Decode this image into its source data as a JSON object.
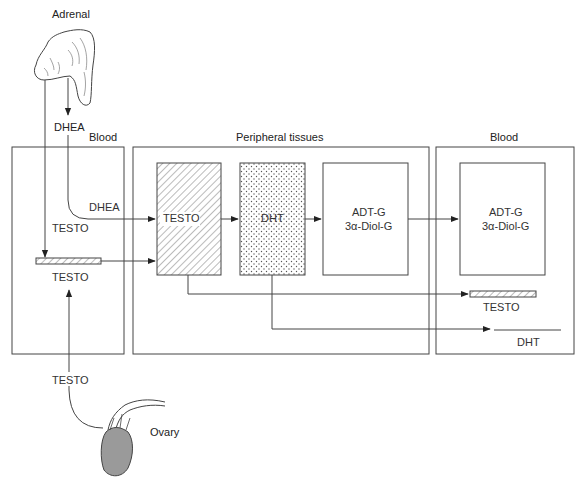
{
  "diagram": {
    "organs": {
      "adrenal": {
        "label": "Adrenal",
        "output": "DHEA"
      },
      "ovary": {
        "label": "Ovary",
        "output": "TESTO"
      }
    },
    "compartments": [
      {
        "id": "blood-left",
        "title": "Blood",
        "labels": {
          "dhea": "DHEA",
          "testo_in": "TESTO",
          "testo_bar": "TESTO"
        }
      },
      {
        "id": "peripheral",
        "title": "Peripheral tissues",
        "boxes": [
          {
            "id": "testo",
            "label": "TESTO",
            "fill": "hatched"
          },
          {
            "id": "dht",
            "label": "DHT",
            "fill": "dotted"
          },
          {
            "id": "glucuronides",
            "line1": "ADT-G",
            "line2": "3α-Diol-G",
            "fill": "none"
          }
        ]
      },
      {
        "id": "blood-right",
        "title": "Blood",
        "box": {
          "line1": "ADT-G",
          "line2": "3α-Diol-G"
        },
        "labels": {
          "testo": "TESTO",
          "dht": "DHT"
        }
      }
    ],
    "colors": {
      "line": "#444444",
      "fill_ovary": "#9a9a9a",
      "background": "#ffffff"
    }
  }
}
